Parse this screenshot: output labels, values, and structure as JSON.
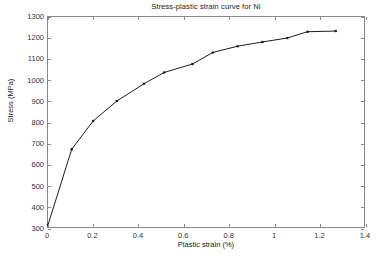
{
  "chart_data": {
    "type": "line",
    "title": "Stress-plastic strain curve for Ni",
    "xlabel": "Plastic strain (%)",
    "ylabel": "Stress (MPa)",
    "xlim": [
      0,
      1.4
    ],
    "ylim": [
      300,
      1300
    ],
    "xticks": [
      "0",
      "0.2",
      "0.4",
      "0.6",
      "0.8",
      "1",
      "1.2",
      "1.4"
    ],
    "xtick_values": [
      0,
      0.2,
      0.4,
      0.6,
      0.8,
      1.0,
      1.2,
      1.4
    ],
    "yticks": [
      "300",
      "400",
      "500",
      "600",
      "700",
      "800",
      "900",
      "1000",
      "1100",
      "1200",
      "1300"
    ],
    "ytick_values": [
      300,
      400,
      500,
      600,
      700,
      800,
      900,
      1000,
      1100,
      1200,
      1300
    ],
    "grid": false,
    "legend": null,
    "marker": "point",
    "line_color": "#1a1a1a",
    "series": [
      {
        "name": "Ni",
        "x": [
          0.0,
          0.105,
          0.2,
          0.305,
          0.425,
          0.515,
          0.64,
          0.73,
          0.84,
          0.95,
          1.06,
          1.15,
          1.275
        ],
        "y": [
          310,
          670,
          805,
          900,
          982,
          1036,
          1076,
          1131,
          1161,
          1181,
          1200,
          1230,
          1233
        ]
      }
    ]
  },
  "axes": {
    "x_min": 0,
    "x_max": 1.4,
    "y_min": 300,
    "y_max": 1300
  }
}
